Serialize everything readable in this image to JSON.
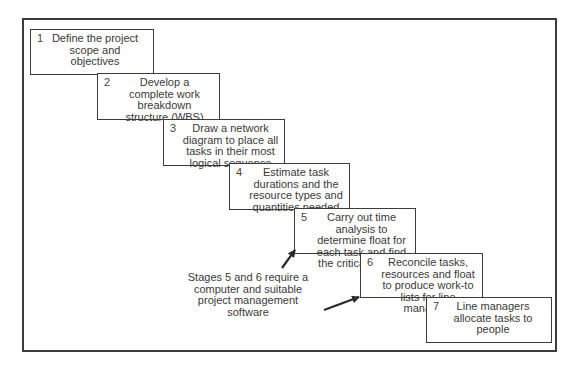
{
  "diagram": {
    "type": "staircase-process",
    "steps": [
      {
        "number": "1",
        "text": "Define the project scope and objectives"
      },
      {
        "number": "2",
        "text": "Develop a complete work breakdown structure (WBS)"
      },
      {
        "number": "3",
        "text": "Draw a network diagram to place all tasks in their most logical sequence"
      },
      {
        "number": "4",
        "text": "Estimate task durations and the resource types and quantities needed"
      },
      {
        "number": "5",
        "text": "Carry out time analysis to determine float for each task and find the critical path(s)"
      },
      {
        "number": "6",
        "text": "Reconcile tasks, resources and float to produce work-to lists for line managers"
      },
      {
        "number": "7",
        "text": "Line managers allocate tasks to people"
      }
    ],
    "annotation": {
      "text": "Stages 5 and 6 require a computer and suitable project management software",
      "points_to": [
        "5",
        "6"
      ]
    },
    "colors": {
      "line": "#3c3c3c",
      "text": "#3a3a3a",
      "background": "#ffffff"
    }
  }
}
